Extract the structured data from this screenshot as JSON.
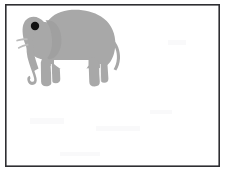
{
  "figure": {
    "title": "Elephant silhouette line drawing",
    "canvas": {
      "width": 226,
      "height": 174,
      "background_color": "#ffffff"
    },
    "frame": {
      "name": "image-border",
      "x": 5,
      "y": 4,
      "width": 215,
      "height": 163,
      "stroke_color": "#2e2e32",
      "stroke_width": 1.6,
      "fill": "none"
    },
    "subject": {
      "name": "elephant",
      "kind": "animal-silhouette",
      "fill_color": "#a8a8a8",
      "outline_color": "#9a9a9a",
      "facing": "left",
      "bounding_box": {
        "x": 18,
        "y": 9,
        "width": 106,
        "height": 78
      },
      "parts": [
        {
          "name": "body",
          "fill_color": "#a8a8a8"
        },
        {
          "name": "head",
          "fill_color": "#a8a8a8"
        },
        {
          "name": "ear",
          "fill_color": "#a0a0a0"
        },
        {
          "name": "trunk",
          "fill_color": "#a8a8a8"
        },
        {
          "name": "tusk-upper",
          "fill_color": "#bcbcbc"
        },
        {
          "name": "tusk-lower",
          "fill_color": "#bcbcbc"
        },
        {
          "name": "front-leg-near",
          "fill_color": "#a8a8a8"
        },
        {
          "name": "front-leg-far",
          "fill_color": "#a8a8a8"
        },
        {
          "name": "hind-leg-near",
          "fill_color": "#a8a8a8"
        },
        {
          "name": "hind-leg-far",
          "fill_color": "#a8a8a8"
        },
        {
          "name": "tail",
          "fill_color": "#a8a8a8"
        }
      ],
      "eye": {
        "name": "eye",
        "shape": "circle",
        "center_x": 35,
        "center_y": 26,
        "radius": 4.2,
        "fill_color": "#111111"
      }
    }
  }
}
